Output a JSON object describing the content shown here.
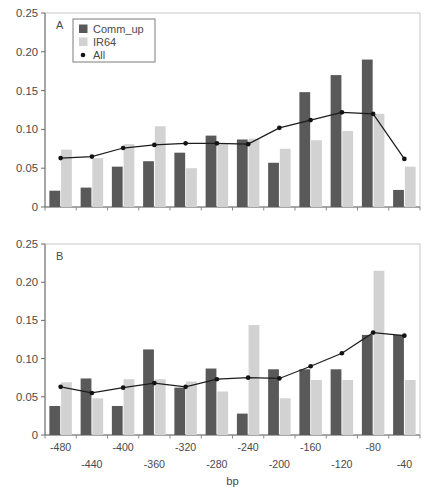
{
  "figure": {
    "axis_label_x": "bp",
    "y_ticks": [
      "0",
      "0.05",
      "0.10",
      "0.15",
      "0.20",
      "0.25"
    ],
    "x_ticks": [
      "-480",
      "-440",
      "-400",
      "-360",
      "-320",
      "-280",
      "-240",
      "-200",
      "-160",
      "-120",
      "-80",
      "-40"
    ],
    "panel_a_label": "A",
    "panel_b_label": "B",
    "legend": [
      {
        "label": "Comm_up",
        "marker": "square-swatch-dark",
        "color": "#595959"
      },
      {
        "label": "IR64",
        "marker": "square-swatch-light",
        "color": "#d2d2d2"
      },
      {
        "label": "All",
        "marker": "dot-marker",
        "color": "#131313"
      }
    ],
    "colors": {
      "comm_up": "#595959",
      "ir64": "#d2d2d2",
      "all_line": "#131313",
      "frame": "#c8c8c8",
      "axis": "#6b6b6b",
      "text": "#4a4a4a"
    }
  },
  "chart_data": [
    {
      "type": "bar",
      "panel": "A",
      "title": "A",
      "xlabel": "bp",
      "ylabel": "",
      "ylim": [
        0,
        0.25
      ],
      "yticks": [
        0,
        0.05,
        0.1,
        0.15,
        0.2,
        0.25
      ],
      "grid": false,
      "legend_position": "top-left-inside",
      "categories": [
        "-480",
        "-440",
        "-400",
        "-360",
        "-320",
        "-280",
        "-240",
        "-200",
        "-160",
        "-120",
        "-80",
        "-40"
      ],
      "series": [
        {
          "name": "Comm_up",
          "kind": "bar",
          "color": "#595959",
          "values": [
            0.021,
            0.025,
            0.052,
            0.059,
            0.07,
            0.092,
            0.087,
            0.057,
            0.148,
            0.17,
            0.19,
            0.022
          ]
        },
        {
          "name": "IR64",
          "kind": "bar",
          "color": "#d2d2d2",
          "values": [
            0.074,
            0.063,
            0.081,
            0.104,
            0.05,
            0.082,
            0.088,
            0.075,
            0.086,
            0.098,
            0.12,
            0.052
          ]
        },
        {
          "name": "All",
          "kind": "line",
          "color": "#131313",
          "values": [
            0.063,
            0.065,
            0.076,
            0.08,
            0.082,
            0.082,
            0.081,
            0.102,
            0.112,
            0.122,
            0.12,
            0.062
          ]
        }
      ]
    },
    {
      "type": "bar",
      "panel": "B",
      "title": "B",
      "xlabel": "bp",
      "ylabel": "",
      "ylim": [
        0,
        0.25
      ],
      "yticks": [
        0,
        0.05,
        0.1,
        0.15,
        0.2,
        0.25
      ],
      "grid": false,
      "legend_position": "none",
      "categories": [
        "-480",
        "-440",
        "-400",
        "-360",
        "-320",
        "-280",
        "-240",
        "-200",
        "-160",
        "-120",
        "-80",
        "-40"
      ],
      "series": [
        {
          "name": "Comm_up",
          "kind": "bar",
          "color": "#595959",
          "values": [
            0.038,
            0.074,
            0.038,
            0.112,
            0.062,
            0.087,
            0.028,
            0.086,
            0.086,
            0.086,
            0.131,
            0.131
          ]
        },
        {
          "name": "IR64",
          "kind": "bar",
          "color": "#d2d2d2",
          "values": [
            0.069,
            0.048,
            0.073,
            0.073,
            0.07,
            0.057,
            0.144,
            0.048,
            0.072,
            0.072,
            0.215,
            0.072
          ]
        },
        {
          "name": "All",
          "kind": "line",
          "color": "#131313",
          "values": [
            0.063,
            0.055,
            0.062,
            0.068,
            0.063,
            0.073,
            0.075,
            0.074,
            0.09,
            0.107,
            0.134,
            0.13
          ]
        }
      ]
    }
  ]
}
